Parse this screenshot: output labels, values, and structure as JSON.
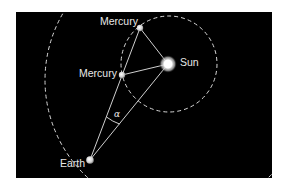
{
  "diagram": {
    "colors": {
      "page_background": "#ffffff",
      "panel_background": "#000000",
      "lines": "#e6e6e6",
      "orbits": "#d8d8d8",
      "labels": "#e8e8e8"
    },
    "bodies": {
      "sun": {
        "label": "Sun"
      },
      "mercury_top": {
        "label": "Mercury"
      },
      "mercury_middle": {
        "label": "Mercury"
      },
      "earth": {
        "label": "Earth"
      }
    },
    "angle": {
      "label": "α"
    }
  }
}
